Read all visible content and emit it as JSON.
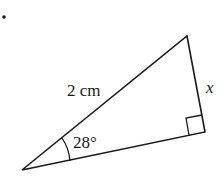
{
  "problem_marker": "•",
  "triangle": {
    "vertices": {
      "A": [
        22,
        170
      ],
      "B": [
        187,
        36
      ],
      "C": [
        205,
        132
      ]
    },
    "hypotenuse_label": "2 cm",
    "opposite_side_label": "x",
    "angle_label": "28°",
    "right_angle_at": "C",
    "stroke_color": "#1a1a1a"
  }
}
